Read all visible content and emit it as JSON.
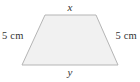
{
  "figure": {
    "name": "trapezoid-diagram",
    "shape_type": "isosceles-trapezoid",
    "background_color": "#ffffff",
    "fill_color": "#f1f1f1",
    "stroke_color": "#b5b5b5",
    "stroke_width": 1,
    "vertices": [
      {
        "name": "top-left",
        "x": 45,
        "y": 15
      },
      {
        "name": "top-right",
        "x": 96,
        "y": 15
      },
      {
        "name": "bottom-right",
        "x": 118,
        "y": 65
      },
      {
        "name": "bottom-left",
        "x": 22,
        "y": 65
      }
    ],
    "polygon_points": "45,15 96,15 118,65 22,65"
  },
  "labels": {
    "top": "x",
    "bottom": "y",
    "left": "5 cm",
    "right": "5 cm",
    "text_color": "#333333"
  }
}
